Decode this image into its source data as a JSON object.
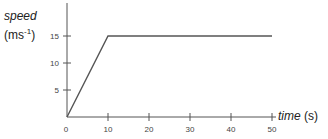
{
  "chart_data": {
    "type": "line",
    "title": "",
    "xlabel_main": "time",
    "xlabel_unit": "(s)",
    "ylabel_main": "speed",
    "ylabel_unit_pre": "(ms",
    "ylabel_unit_sup": "-1",
    "ylabel_unit_post": ")",
    "xlim": [
      0,
      50
    ],
    "ylim": [
      0,
      17
    ],
    "x_ticks": [
      0,
      10,
      20,
      30,
      40,
      50
    ],
    "y_ticks": [
      5,
      10,
      15
    ],
    "origin_label": "0",
    "series": [
      {
        "name": "speed",
        "x": [
          0,
          10,
          50
        ],
        "y": [
          0,
          15,
          15
        ]
      }
    ],
    "grid": false,
    "colors": {
      "axis": "#555555",
      "line": "#555555",
      "text": "#444444"
    }
  }
}
